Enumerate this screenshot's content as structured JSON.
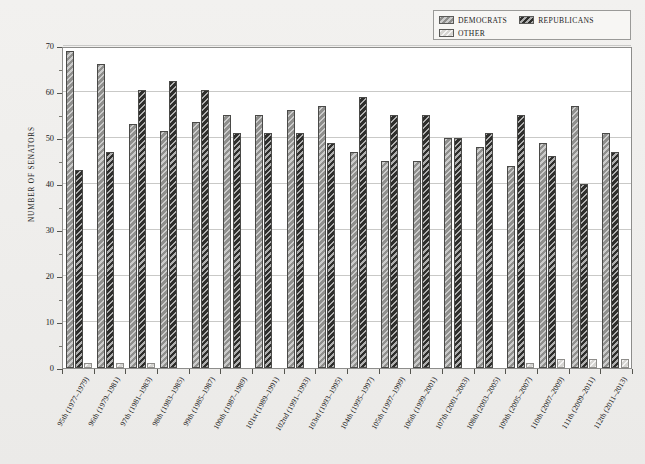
{
  "chart_data": {
    "type": "bar",
    "title": "",
    "xlabel": "",
    "ylabel": "NUMBER OF SENATORS",
    "ylim": [
      0,
      70
    ],
    "ytick_step": 10,
    "yminor_step": 5,
    "grid": true,
    "legend_position": "top-right",
    "categories": [
      "95th (1977–1979)",
      "96th (1979–1981)",
      "97th (1981–1983)",
      "98th (1983–1985)",
      "99th (1985–1987)",
      "100th (1987–1989)",
      "101st (1989–1991)",
      "102nd (1991–1993)",
      "103rd (1993–1995)",
      "104th (1995–1997)",
      "105th (1997–1999)",
      "106th (1999–2001)",
      "107th (2001–2003)",
      "108th (2003–2005)",
      "109th (2005–2007)",
      "110th (2007–2009)",
      "111th (2009–2011)",
      "112th (2011–2013)"
    ],
    "ytick_labels": [
      "0",
      "10",
      "20",
      "30",
      "40",
      "50",
      "60",
      "70"
    ],
    "series": [
      {
        "name": "DEMOCRATS",
        "color": "#8f8f8d",
        "values": [
          69,
          66,
          53,
          51.5,
          53.5,
          55,
          55,
          56,
          57,
          47,
          45,
          45,
          50,
          48,
          44,
          49,
          57,
          51
        ]
      },
      {
        "name": "REPUBLICANS",
        "color": "#2e2e2c",
        "values": [
          43,
          47,
          60.5,
          62.5,
          60.5,
          51,
          51,
          51,
          49,
          59,
          55,
          55,
          50,
          51,
          55,
          46,
          40,
          47
        ]
      },
      {
        "name": "OTHER",
        "color": "#d6d5d2",
        "values": [
          1,
          1,
          1,
          0,
          0,
          0,
          0,
          0,
          0,
          0,
          0,
          0,
          0,
          0,
          1,
          2,
          2,
          2
        ]
      }
    ]
  },
  "legend": {
    "entries": [
      {
        "label": "DEMOCRATS",
        "swatch": "dem"
      },
      {
        "label": "REPUBLICANS",
        "swatch": "rep"
      },
      {
        "label": "OTHER",
        "swatch": "oth"
      }
    ]
  },
  "axis": {
    "y_title": "NUMBER OF SENATORS"
  }
}
